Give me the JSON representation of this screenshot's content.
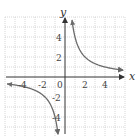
{
  "chart_data": {
    "type": "line",
    "title": "",
    "function": "y = 4/x",
    "xlabel": "x",
    "ylabel": "y",
    "xlim": [
      -6,
      6
    ],
    "ylim": [
      -6,
      6
    ],
    "grid": true,
    "x_ticks": [
      -4,
      -2,
      0,
      2,
      4
    ],
    "y_ticks": [
      -4,
      -2,
      2,
      4
    ],
    "x_tick_labels": [
      "-4",
      "-2",
      "0",
      "2",
      "4"
    ],
    "y_tick_labels": [
      "-4",
      "-2",
      "2",
      "4"
    ],
    "series": [
      {
        "name": "branch-positive",
        "x": [
          0.7,
          1,
          1.5,
          2,
          3,
          4,
          5,
          5.8
        ],
        "y": [
          5.7,
          4,
          2.67,
          2,
          1.33,
          1,
          0.8,
          0.69
        ]
      },
      {
        "name": "branch-negative",
        "x": [
          -5.8,
          -5,
          -4,
          -3,
          -2,
          -1.5,
          -1,
          -0.7
        ],
        "y": [
          -0.69,
          -0.8,
          -1,
          -1.33,
          -2,
          -2.67,
          -4,
          -5.7
        ]
      }
    ]
  },
  "labels": {
    "x_axis": "x",
    "y_axis": "y",
    "ticks_x": [
      "-4",
      "-2",
      "0",
      "2",
      "4"
    ],
    "ticks_y": [
      "4",
      "2",
      "-2",
      "-4"
    ]
  },
  "colors": {
    "axis": "#333333",
    "curve": "#6b6b6b",
    "grid": "#bdbdbd"
  }
}
